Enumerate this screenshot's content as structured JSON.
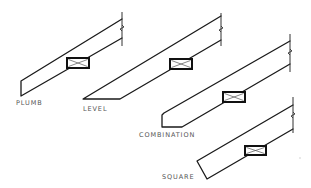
{
  "diagram": {
    "stroke_color": "#1a1a1a",
    "label_color": "#555555",
    "rafters": [
      {
        "name": "plumb",
        "label": "PLUMB",
        "label_pos": [
          16,
          101
        ],
        "cut_type": "plumb"
      },
      {
        "name": "level",
        "label": "LEVEL",
        "label_pos": [
          83,
          107
        ],
        "cut_type": "level"
      },
      {
        "name": "combination",
        "label": "COMBINATION",
        "label_pos": [
          139,
          132
        ],
        "cut_type": "combination"
      },
      {
        "name": "square",
        "label": "SQUARE",
        "label_pos": [
          162,
          174
        ],
        "cut_type": "square"
      }
    ]
  }
}
